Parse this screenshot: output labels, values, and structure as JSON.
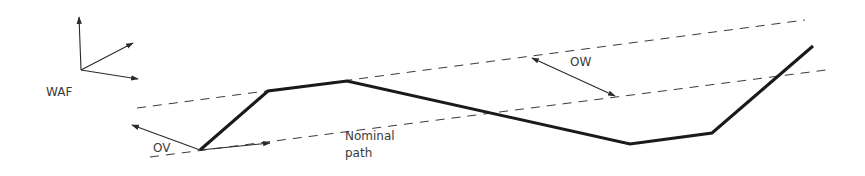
{
  "diagram": {
    "background": "#ffffff",
    "line_color": "#1a1a1a",
    "labels": {
      "frame": "WAF",
      "offset_vector": "OV",
      "offset_width": "OW",
      "nominal_path_line1": "Nominal",
      "nominal_path_line2": "path"
    },
    "actual_path_points": [
      [
        200,
        150
      ],
      [
        268,
        91
      ],
      [
        347,
        81
      ],
      [
        630,
        144
      ],
      [
        712,
        133
      ],
      [
        813,
        46
      ]
    ],
    "upper_boundary": [
      [
        137,
        108
      ],
      [
        805,
        20
      ]
    ],
    "lower_boundary": [
      [
        150,
        157
      ],
      [
        826,
        70
      ]
    ],
    "frame_axes": {
      "origin": [
        81,
        70
      ],
      "axis_tips": [
        [
          79,
          16
        ],
        [
          134,
          43
        ],
        [
          139,
          79
        ]
      ]
    },
    "arrows": {
      "offset_vector": {
        "from": [
          200,
          150
        ],
        "to": [
          131,
          125
        ]
      },
      "nominal_direction": {
        "from": [
          200,
          150
        ],
        "to": [
          270,
          143
        ]
      },
      "offset_width": {
        "from": [
          532,
          58
        ],
        "to": [
          615,
          96
        ],
        "double_headed": true
      }
    }
  }
}
